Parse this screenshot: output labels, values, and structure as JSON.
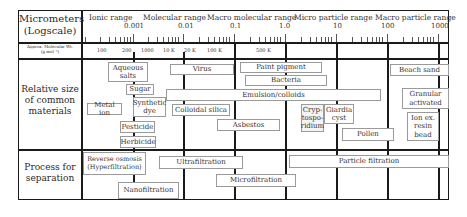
{
  "header": {
    "scale_label": "Micrometers\n(Logscale)",
    "mw_label": "Approx. Molecular Wt.\n(g mol⁻¹)",
    "ranges": [
      "Ionic range",
      "Molecular range",
      "Macro molecular range",
      "Micro particle range",
      "Macro particle range"
    ],
    "scale_ticks": [
      "0.001",
      "0.01",
      "0.1",
      "1.0",
      "10",
      "100",
      "1000"
    ],
    "molecular_weights": [
      "100",
      "200",
      "1000",
      "10 K",
      "20 K",
      "100 K",
      "500 K"
    ]
  },
  "rows": {
    "materials_label": "Relative size\nof common\nmaterials",
    "process_label": "Process for\nseparation"
  },
  "materials": [
    {
      "label": "Aqueous\nsalts"
    },
    {
      "label": "Virus"
    },
    {
      "label": "Paint pigment"
    },
    {
      "label": "Bacteria"
    },
    {
      "label": "Beach sand"
    },
    {
      "label": "Sugar"
    },
    {
      "label": "Metal ion"
    },
    {
      "label": "Synthetic\ndye"
    },
    {
      "label": "Emulsion/colloids"
    },
    {
      "label": "Colloidal silica"
    },
    {
      "label": "Granular\nactivated"
    },
    {
      "label": "Cryp-\ntospo-\nridium"
    },
    {
      "label": "Giardia\ncyst"
    },
    {
      "label": "Asbestos"
    },
    {
      "label": "Ion ex.\nresin\nbead"
    },
    {
      "label": "Pesticide"
    },
    {
      "label": "Pollen"
    },
    {
      "label": "Herbicide"
    }
  ],
  "processes": [
    {
      "label": "Reverse osmosis\n(Hyperfiltration)"
    },
    {
      "label": "Ultrafiltration"
    },
    {
      "label": "Particle filtration"
    },
    {
      "label": "Microfiltration"
    },
    {
      "label": "Nanofiltration"
    }
  ]
}
